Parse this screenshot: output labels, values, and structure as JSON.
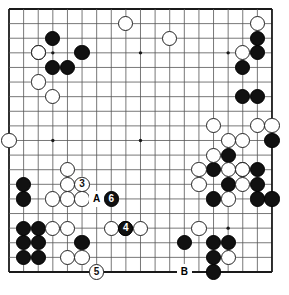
{
  "board": {
    "kind": "go-board",
    "size": 19,
    "left": 9,
    "top": 9,
    "spacing": 14.61,
    "line_color": "#555555",
    "border_color": "#1a1a1a",
    "background_color": "#ffffff",
    "stone_radius": 7.6,
    "star_points": [
      [
        3,
        3
      ],
      [
        9,
        3
      ],
      [
        15,
        3
      ],
      [
        3,
        9
      ],
      [
        9,
        9
      ],
      [
        15,
        9
      ],
      [
        3,
        15
      ],
      [
        9,
        15
      ],
      [
        15,
        15
      ]
    ]
  },
  "stones": {
    "black": [
      [
        3,
        2
      ],
      [
        2,
        3
      ],
      [
        5,
        3
      ],
      [
        3,
        4
      ],
      [
        4,
        4
      ],
      [
        17,
        2
      ],
      [
        17,
        3
      ],
      [
        16,
        4
      ],
      [
        16,
        6
      ],
      [
        17,
        6
      ],
      [
        18,
        9
      ],
      [
        15,
        10
      ],
      [
        14,
        11
      ],
      [
        16,
        11
      ],
      [
        17,
        11
      ],
      [
        15,
        12
      ],
      [
        17,
        12
      ],
      [
        14,
        13
      ],
      [
        17,
        13
      ],
      [
        18,
        13
      ],
      [
        1,
        12
      ],
      [
        1,
        13
      ],
      [
        1,
        15
      ],
      [
        2,
        15
      ],
      [
        1,
        16
      ],
      [
        2,
        16
      ],
      [
        1,
        17
      ],
      [
        2,
        17
      ],
      [
        5,
        16
      ],
      [
        8,
        15
      ],
      [
        12,
        16
      ],
      [
        14,
        16
      ],
      [
        15,
        16
      ],
      [
        14,
        17
      ],
      [
        14,
        18
      ]
    ],
    "white": [
      [
        0,
        9
      ],
      [
        2,
        3
      ],
      [
        2,
        5
      ],
      [
        3,
        6
      ],
      [
        8,
        1
      ],
      [
        11,
        2
      ],
      [
        17,
        1
      ],
      [
        16,
        3
      ],
      [
        14,
        8
      ],
      [
        17,
        8
      ],
      [
        18,
        8
      ],
      [
        15,
        9
      ],
      [
        16,
        9
      ],
      [
        14,
        10
      ],
      [
        13,
        11
      ],
      [
        15,
        11
      ],
      [
        16,
        11
      ],
      [
        13,
        12
      ],
      [
        16,
        12
      ],
      [
        15,
        13
      ],
      [
        4,
        11
      ],
      [
        4,
        12
      ],
      [
        3,
        13
      ],
      [
        4,
        13
      ],
      [
        5,
        13
      ],
      [
        3,
        15
      ],
      [
        4,
        15
      ],
      [
        7,
        15
      ],
      [
        9,
        15
      ],
      [
        13,
        15
      ],
      [
        4,
        17
      ],
      [
        5,
        17
      ],
      [
        15,
        17
      ]
    ]
  },
  "numbered_moves": [
    {
      "id": "move-3",
      "label": "3",
      "color": "white",
      "col": 5,
      "row": 12
    },
    {
      "id": "move-4",
      "label": "4",
      "color": "black",
      "col": 8,
      "row": 15
    },
    {
      "id": "move-5",
      "label": "5",
      "color": "white",
      "col": 6,
      "row": 18
    },
    {
      "id": "move-6",
      "label": "6",
      "color": "black",
      "col": 7,
      "row": 13
    }
  ],
  "point_labels": [
    {
      "id": "label-a",
      "label": "A",
      "col": 6,
      "row": 13
    },
    {
      "id": "label-b",
      "label": "B",
      "col": 12,
      "row": 18
    }
  ]
}
